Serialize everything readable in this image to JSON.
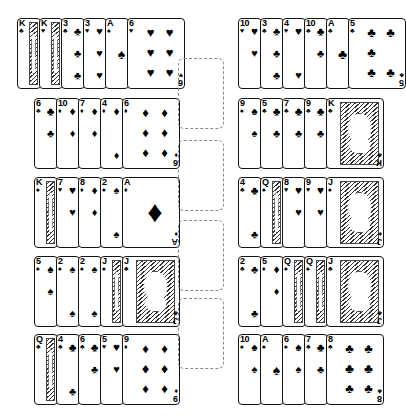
{
  "view": {
    "title": "Card Tableau",
    "background_color": "#ffffff",
    "card_face_color": "#ffffff",
    "card_border_color": "#141414",
    "pip_color": "#000000",
    "empty_slot_border_color": "#8a8a8a",
    "layout": "three-column: 5 left piles, 4 empty center slots, 5 right piles",
    "total_piles": 10,
    "total_cards": 53,
    "total_empty_slots": 4
  },
  "suits": {
    "spade": "♠",
    "heart": "♥",
    "diamond": "♦",
    "club": "♣"
  },
  "left_column": {
    "name": "left-tableau",
    "piles": [
      {
        "index": 1,
        "left": 17,
        "top": 18,
        "cards": [
          {
            "rank": "K",
            "suit": "club",
            "face": true,
            "full": false
          },
          {
            "rank": "K",
            "suit": "heart",
            "face": true,
            "full": false
          },
          {
            "rank": "3",
            "suit": "club",
            "face": false,
            "full": false
          },
          {
            "rank": "3",
            "suit": "heart",
            "face": false,
            "full": false
          },
          {
            "rank": "A",
            "suit": "spade",
            "face": false,
            "full": false
          },
          {
            "rank": "6",
            "suit": "heart",
            "face": false,
            "full": true
          }
        ]
      },
      {
        "index": 2,
        "left": 34,
        "top": 98,
        "cards": [
          {
            "rank": "6",
            "suit": "club",
            "face": false,
            "full": false
          },
          {
            "rank": "10",
            "suit": "diamond",
            "face": false,
            "full": false
          },
          {
            "rank": "7",
            "suit": "diamond",
            "face": false,
            "full": false
          },
          {
            "rank": "4",
            "suit": "diamond",
            "face": false,
            "full": false
          },
          {
            "rank": "6",
            "suit": "diamond",
            "face": false,
            "full": true
          }
        ]
      },
      {
        "index": 3,
        "left": 34,
        "top": 177,
        "cards": [
          {
            "rank": "K",
            "suit": "spade",
            "face": true,
            "full": false
          },
          {
            "rank": "7",
            "suit": "heart",
            "face": false,
            "full": false
          },
          {
            "rank": "8",
            "suit": "diamond",
            "face": false,
            "full": false
          },
          {
            "rank": "2",
            "suit": "spade",
            "face": false,
            "full": false
          },
          {
            "rank": "A",
            "suit": "diamond",
            "face": false,
            "full": true
          }
        ]
      },
      {
        "index": 4,
        "left": 34,
        "top": 256,
        "cards": [
          {
            "rank": "5",
            "suit": "spade",
            "face": false,
            "full": false
          },
          {
            "rank": "2",
            "suit": "spade",
            "face": false,
            "full": false
          },
          {
            "rank": "2",
            "suit": "spade",
            "face": false,
            "full": false
          },
          {
            "rank": "J",
            "suit": "spade",
            "face": true,
            "full": false
          },
          {
            "rank": "J",
            "suit": "club",
            "face": true,
            "full": true
          }
        ]
      },
      {
        "index": 5,
        "left": 34,
        "top": 334,
        "cards": [
          {
            "rank": "Q",
            "suit": "club",
            "face": true,
            "full": false
          },
          {
            "rank": "4",
            "suit": "club",
            "face": false,
            "full": false
          },
          {
            "rank": "6",
            "suit": "club",
            "face": false,
            "full": false
          },
          {
            "rank": "5",
            "suit": "heart",
            "face": false,
            "full": false
          },
          {
            "rank": "9",
            "suit": "diamond",
            "face": false,
            "full": true
          }
        ]
      }
    ]
  },
  "center_column": {
    "name": "foundation-slots",
    "slots": [
      {
        "index": 1,
        "left": 8,
        "top": 58,
        "label": "empty"
      },
      {
        "index": 2,
        "left": 8,
        "top": 140,
        "label": "empty"
      },
      {
        "index": 3,
        "left": 8,
        "top": 220,
        "label": "empty"
      },
      {
        "index": 4,
        "left": 8,
        "top": 298,
        "label": "empty"
      }
    ]
  },
  "right_column": {
    "name": "right-tableau",
    "piles": [
      {
        "index": 1,
        "left": 6,
        "top": 18,
        "cards": [
          {
            "rank": "10",
            "suit": "heart",
            "face": false,
            "full": false
          },
          {
            "rank": "3",
            "suit": "club",
            "face": false,
            "full": false
          },
          {
            "rank": "4",
            "suit": "heart",
            "face": false,
            "full": false
          },
          {
            "rank": "10",
            "suit": "club",
            "face": false,
            "full": false
          },
          {
            "rank": "A",
            "suit": "club",
            "face": false,
            "full": false
          },
          {
            "rank": "5",
            "suit": "club",
            "face": false,
            "full": true
          }
        ]
      },
      {
        "index": 2,
        "left": 6,
        "top": 98,
        "cards": [
          {
            "rank": "9",
            "suit": "spade",
            "face": false,
            "full": false
          },
          {
            "rank": "5",
            "suit": "club",
            "face": false,
            "full": false
          },
          {
            "rank": "7",
            "suit": "club",
            "face": false,
            "full": false
          },
          {
            "rank": "9",
            "suit": "club",
            "face": false,
            "full": false
          },
          {
            "rank": "K",
            "suit": "club",
            "face": true,
            "full": true
          }
        ]
      },
      {
        "index": 3,
        "left": 6,
        "top": 177,
        "cards": [
          {
            "rank": "4",
            "suit": "club",
            "face": false,
            "full": false
          },
          {
            "rank": "Q",
            "suit": "spade",
            "face": true,
            "full": false
          },
          {
            "rank": "8",
            "suit": "heart",
            "face": false,
            "full": false
          },
          {
            "rank": "9",
            "suit": "heart",
            "face": false,
            "full": false
          },
          {
            "rank": "J",
            "suit": "spade",
            "face": true,
            "full": true
          }
        ]
      },
      {
        "index": 4,
        "left": 6,
        "top": 256,
        "cards": [
          {
            "rank": "2",
            "suit": "club",
            "face": false,
            "full": false
          },
          {
            "rank": "5",
            "suit": "diamond",
            "face": false,
            "full": false
          },
          {
            "rank": "Q",
            "suit": "spade",
            "face": true,
            "full": false
          },
          {
            "rank": "Q",
            "suit": "spade",
            "face": true,
            "full": false
          },
          {
            "rank": "J",
            "suit": "club",
            "face": true,
            "full": true
          }
        ]
      },
      {
        "index": 5,
        "left": 6,
        "top": 334,
        "cards": [
          {
            "rank": "10",
            "suit": "spade",
            "face": false,
            "full": false
          },
          {
            "rank": "A",
            "suit": "spade",
            "face": false,
            "full": false
          },
          {
            "rank": "6",
            "suit": "spade",
            "face": false,
            "full": false
          },
          {
            "rank": "7",
            "suit": "club",
            "face": false,
            "full": false
          },
          {
            "rank": "8",
            "suit": "club",
            "face": false,
            "full": true
          }
        ]
      }
    ]
  }
}
